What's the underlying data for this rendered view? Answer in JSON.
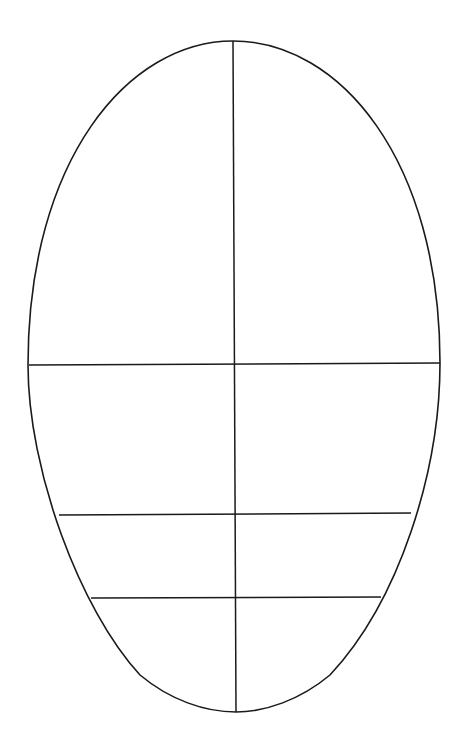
{
  "diagram": {
    "title": "",
    "type": "face-proportion-guide",
    "stroke_color": "#1a1a1a",
    "background": "#ffffff",
    "outline": {
      "top": [
        233,
        41
      ],
      "bottom": [
        236,
        712
      ],
      "left": [
        28,
        365
      ],
      "right": [
        440,
        363
      ]
    },
    "center_line": {
      "x1": 233,
      "y1": 41,
      "x2": 236,
      "y2": 712
    },
    "guide_lines": [
      {
        "name": "eye-line",
        "x1": 29,
        "y1": 365,
        "x2": 440,
        "y2": 363
      },
      {
        "name": "nose-line",
        "x1": 59,
        "y1": 515,
        "x2": 411,
        "y2": 513
      },
      {
        "name": "mouth-line",
        "x1": 91,
        "y1": 598,
        "x2": 381,
        "y2": 597
      }
    ]
  }
}
